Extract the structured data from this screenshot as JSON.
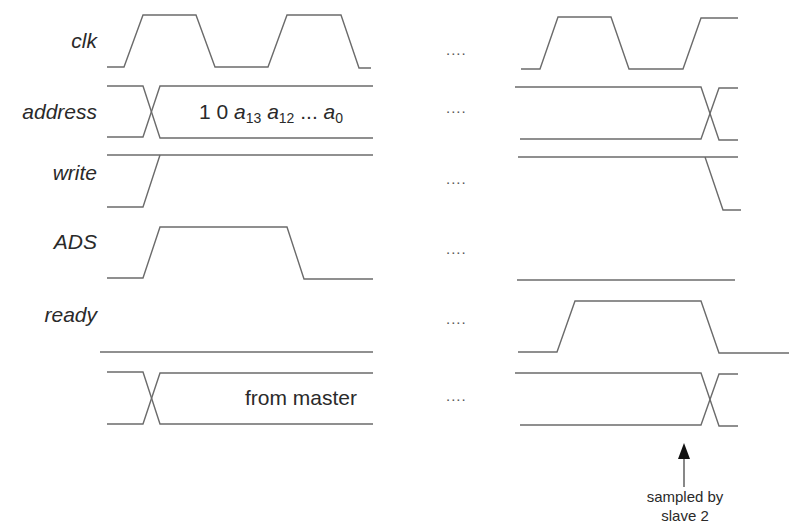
{
  "diagram": {
    "type": "timing-diagram",
    "stroke_color": "#6b6b6b",
    "text_color": "#2a2a2a",
    "ellipsis": "....",
    "signals": [
      {
        "name": "clk",
        "label_top": 29
      },
      {
        "name": "address",
        "label_top": 100
      },
      {
        "name": "write",
        "label_top": 161
      },
      {
        "name": "ADS",
        "label_top": 230
      },
      {
        "name": "ready",
        "label_top": 303
      },
      {
        "name": "data",
        "label_top": 386
      }
    ],
    "bus_values": {
      "address": {
        "prefix": "1 0 ",
        "a13": "a",
        "a13_sub": "13",
        "a12": "a",
        "a12_sub": "12",
        "dots": " ... ",
        "a0": "a",
        "a0_sub": "0"
      },
      "data": "from master"
    },
    "ellipsis_rows": [
      41,
      99,
      170,
      240,
      310,
      387
    ],
    "annotation": {
      "line1": "sampled by",
      "line2": "slave 2",
      "arrow": {
        "x": 684,
        "y_tip": 443,
        "y_base": 487
      }
    }
  },
  "waveforms": [
    {
      "id": "clk-left",
      "points": "107,67 124,67 143,15 196,15 215,67 268,67 287,15 341,15 359,68 371,68"
    },
    {
      "id": "clk-right",
      "points": "521,69 540,69 558,17 611,17 629,69 683,69 701,18 738,18"
    },
    {
      "id": "address-left-top",
      "points": "107,86 143,86 160,138 373,138"
    },
    {
      "id": "address-left-bot",
      "points": "107,137 143,137 160,86 373,86"
    },
    {
      "id": "address-right-top",
      "points": "515,87 701,87 719,140 738,140"
    },
    {
      "id": "address-right-bot",
      "points": "520,139 701,139 719,88 738,88"
    },
    {
      "id": "write-left-top",
      "points": "107,155 373,155"
    },
    {
      "id": "write-left-bot",
      "points": "107,207 143,207 160,155"
    },
    {
      "id": "write-right",
      "points": "518,157 738,157 705,157 723,210 741,210"
    },
    {
      "id": "ads-left",
      "points": "107,278 143,278 160,227 287,227 304,279 373,279"
    },
    {
      "id": "ads-right",
      "points": "517,280 735,280"
    },
    {
      "id": "ready-left",
      "points": "100,352 373,352"
    },
    {
      "id": "ready-right",
      "points": "518,352 557,352 575,301 701,301 719,353 789,353"
    },
    {
      "id": "data-left-top",
      "points": "107,372 143,372 160,424 373,424"
    },
    {
      "id": "data-left-bot",
      "points": "107,424 143,424 160,373 373,373"
    },
    {
      "id": "data-right-top",
      "points": "515,373 701,373 719,426 738,426"
    },
    {
      "id": "data-right-bot",
      "points": "520,425 701,425 719,374 738,374"
    }
  ]
}
